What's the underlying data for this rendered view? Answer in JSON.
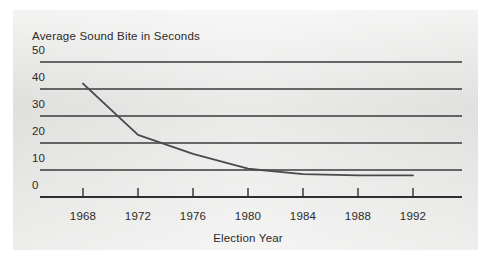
{
  "chart_data": {
    "type": "line",
    "title": "Average Sound Bite in Seconds",
    "xlabel": "Election Year",
    "ylabel": "",
    "x": [
      1968,
      1972,
      1976,
      1980,
      1984,
      1988,
      1992
    ],
    "values": [
      42,
      23,
      16,
      10.5,
      8.5,
      8,
      8
    ],
    "series": [
      {
        "name": "Average Sound Bite in Seconds",
        "values": [
          42,
          23,
          16,
          10.5,
          8.5,
          8,
          8
        ]
      }
    ],
    "categories": [
      "1968",
      "1972",
      "1976",
      "1980",
      "1984",
      "1988",
      "1992"
    ],
    "xtick_labels": [
      "1968",
      "1972",
      "1976",
      "1980",
      "1984",
      "1988",
      "1992"
    ],
    "ytick_labels": [
      "50",
      "40",
      "30",
      "20",
      "10",
      "0"
    ],
    "yticks": [
      50,
      40,
      30,
      20,
      10,
      0
    ],
    "ylim": [
      0,
      50
    ],
    "xlim": [
      1966,
      1994
    ],
    "grid": "horizontal",
    "legend": "none",
    "line_color": "#4a4a4a",
    "axis_color": "#2f2f2f",
    "grid_color": "#3a3a3a",
    "panel_color": "#e9e9e7"
  },
  "figure": {
    "title": "Average Sound Bite in Seconds",
    "xlabel": "Election Year",
    "yticks": [
      {
        "label": "50"
      },
      {
        "label": "40"
      },
      {
        "label": "30"
      },
      {
        "label": "20"
      },
      {
        "label": "10"
      },
      {
        "label": "0"
      }
    ],
    "xticks": [
      {
        "label": "1968"
      },
      {
        "label": "1972"
      },
      {
        "label": "1976"
      },
      {
        "label": "1980"
      },
      {
        "label": "1984"
      },
      {
        "label": "1988"
      },
      {
        "label": "1992"
      }
    ]
  }
}
